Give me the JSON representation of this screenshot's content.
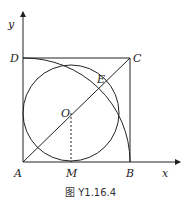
{
  "figure": {
    "caption": "图 Y1.16.4",
    "axes": {
      "x_label": "x",
      "y_label": "y"
    },
    "points": {
      "A": "A",
      "B": "B",
      "C": "C",
      "D": "D",
      "E": "E",
      "O": "O",
      "M": "M"
    },
    "colors": {
      "stroke": "#222222",
      "background": "#ffffff"
    }
  }
}
